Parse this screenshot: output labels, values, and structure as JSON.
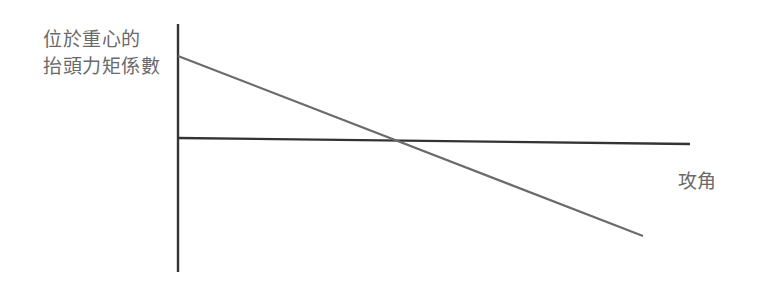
{
  "chart_data": {
    "type": "line",
    "title": "",
    "ylabel_lines": [
      "位於重心的",
      "抬頭力矩係數"
    ],
    "ylabel": "位於重心的抬頭力矩係數",
    "xlabel": "攻角",
    "grid": false,
    "legend": null,
    "axes": {
      "y_axis": {
        "x": 178,
        "y_top": 24,
        "y_bottom": 272,
        "color": "#333333"
      },
      "x_axis": {
        "x_start": 178,
        "y_start": 138,
        "x_end": 690,
        "y_end": 144,
        "color": "#333333"
      }
    },
    "series": [
      {
        "name": "pitching-moment-coefficient",
        "color": "#6b6b6b",
        "points": [
          {
            "x": 178,
            "y": 56
          },
          {
            "x": 398,
            "y": 141
          },
          {
            "x": 643,
            "y": 236
          }
        ],
        "description": "Straight line with negative slope, crossing the x-axis (zero moment) near the middle"
      }
    ]
  }
}
